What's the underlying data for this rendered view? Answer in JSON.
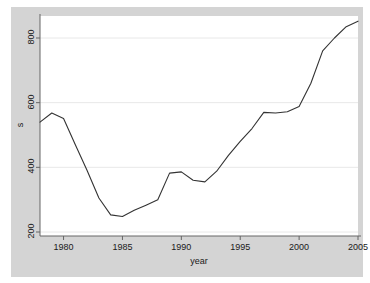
{
  "chart_data": {
    "type": "line",
    "title": "",
    "xlabel": "year",
    "ylabel": "s",
    "xlim": [
      1978,
      2005
    ],
    "ylim": [
      200,
      860
    ],
    "grid": "horizontal",
    "legend": "none",
    "xticks": [
      "1980",
      "1985",
      "1990",
      "1995",
      "2000",
      "2005"
    ],
    "xtick_values": [
      1980,
      1985,
      1990,
      1995,
      2000,
      2005
    ],
    "yticks": [
      "200",
      "400",
      "600",
      "800"
    ],
    "ytick_values": [
      200,
      400,
      600,
      800
    ],
    "line_color": "#333333",
    "panel_color": "#ffffff",
    "region_color": "#d4d4d4",
    "grid_color": "#e8e8e8",
    "x": [
      1978,
      1979,
      1980,
      1981,
      1982,
      1983,
      1984,
      1985,
      1986,
      1987,
      1988,
      1989,
      1990,
      1991,
      1992,
      1993,
      1994,
      1995,
      1996,
      1997,
      1998,
      1999,
      2000,
      2001,
      2002,
      2003,
      2004,
      2005
    ],
    "series": [
      {
        "name": "s",
        "values": [
          540,
          568,
          551,
          470,
          390,
          305,
          253,
          248,
          267,
          283,
          300,
          382,
          386,
          360,
          355,
          388,
          437,
          480,
          520,
          570,
          568,
          572,
          588,
          660,
          760,
          800,
          835,
          852
        ]
      }
    ]
  },
  "axis": {
    "x_title": "year",
    "y_title": "s"
  }
}
